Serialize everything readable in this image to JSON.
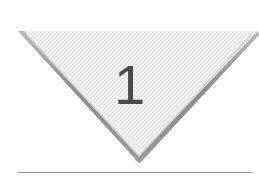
{
  "page": {
    "background_color": "#ffffff",
    "width": 259,
    "height": 193
  },
  "chapter_marker": {
    "shape": "downward-triangle",
    "number": "1",
    "number_color": "#4a4a4a",
    "fill_color": "#e9e9e9",
    "fill_texture": "dithered-halftone",
    "border_color": "#8a8a8a",
    "border_highlight_color": "#b5b5b5",
    "border_width_px": 4,
    "top_edge_has_border": false,
    "geometry": {
      "left_vertex": [
        18,
        31
      ],
      "right_vertex": [
        258,
        31
      ],
      "bottom_vertex": [
        139,
        160
      ]
    }
  },
  "divider": {
    "label": "horizontal-rule",
    "color": "#8f8f99",
    "x_start": 18,
    "x_end": 252,
    "y": 172,
    "thickness_px": 1
  }
}
